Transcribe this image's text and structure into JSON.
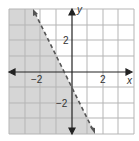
{
  "graph": {
    "inequality": "y < -2x - 1",
    "boundary": {
      "slope": -2,
      "intercept": -1,
      "style": "dashed"
    },
    "shaded_side": "left/below",
    "x_range": [
      -4,
      4
    ],
    "y_range": [
      -4,
      4
    ],
    "axis_labels": {
      "x": "x",
      "y": "y"
    },
    "tick_labels": {
      "x_neg": "−2",
      "x_pos": "2",
      "y_pos": "2",
      "y_neg": "−2"
    },
    "colors": {
      "shade": "#d6d6d6",
      "grid": "#b5b5b5",
      "axis": "#222222",
      "line": "#555555"
    }
  }
}
